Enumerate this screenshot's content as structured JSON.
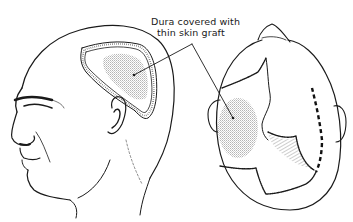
{
  "figure": {
    "annotation": {
      "line1": "Dura covered with",
      "line2": "thin skin graft"
    },
    "views": [
      {
        "name": "lateral-view",
        "description": "Left side profile of head with graft region outlined"
      },
      {
        "name": "superior-view",
        "description": "Top-down view of head with graft region and incisions"
      }
    ],
    "colors": {
      "ink": "#1a1a1a",
      "graft_stipple": "#c8c8c8",
      "background": "#ffffff"
    }
  }
}
